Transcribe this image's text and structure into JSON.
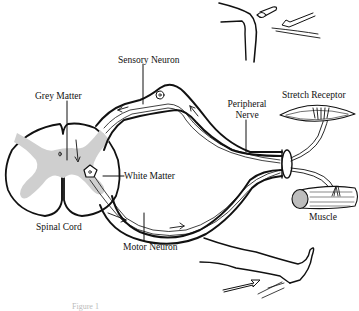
{
  "diagram": {
    "labels": {
      "sensory_neuron": "Sensory Neuron",
      "grey_matter": "Grey Matter",
      "white_matter": "White Matter",
      "spinal_cord": "Spinal Cord",
      "motor_neuron": "Motor Neuron",
      "peripheral_nerve_line1": "Peripheral",
      "peripheral_nerve_line2": "Nerve",
      "stretch_receptor": "Stretch Receptor",
      "muscle": "Muscle",
      "caption": "Figure 1"
    },
    "colors": {
      "ink": "#111111",
      "grey_matter_fill": "#cfcfcf",
      "background": "#ffffff"
    }
  }
}
